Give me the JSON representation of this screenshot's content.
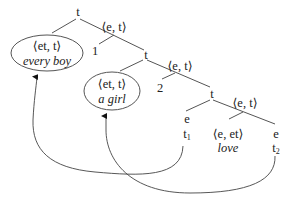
{
  "title_fragment": "",
  "tree": {
    "root": {
      "label": "t"
    },
    "level1": {
      "quantifier": {
        "type": "⟨et, t⟩",
        "word": "every boy"
      },
      "abstraction_type": "⟨e, t⟩",
      "index": "1",
      "node": "t"
    },
    "level2": {
      "quantifier": {
        "type": "⟨et, t⟩",
        "word": "a girl"
      },
      "abstraction_type": "⟨e, t⟩",
      "index": "2",
      "node": "t"
    },
    "level3": {
      "subject": {
        "type": "e",
        "trace": "t",
        "trace_index": "1"
      },
      "vp_type": "⟨e, t⟩",
      "verb": {
        "type": "⟨e, et⟩",
        "word": "love"
      },
      "object": {
        "type": "e",
        "trace": "t",
        "trace_index": "2"
      }
    }
  },
  "movement_arrows": [
    {
      "from": "t1",
      "to": "every boy"
    },
    {
      "from": "t2",
      "to": "a girl"
    }
  ],
  "colors": {
    "line": "#555555",
    "text": "#222222"
  }
}
